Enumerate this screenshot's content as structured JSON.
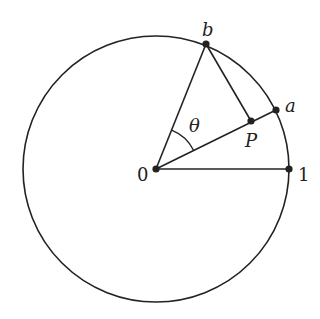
{
  "diagram": {
    "type": "unit-circle-geometry",
    "stroke_color": "#222222",
    "background": "#ffffff",
    "circle": {
      "cx": 156,
      "cy": 169,
      "r": 133
    },
    "points": {
      "origin": {
        "label": "0",
        "x": 156,
        "y": 169
      },
      "one": {
        "label": "1",
        "x": 289,
        "y": 169
      },
      "a": {
        "label": "a",
        "x": 276,
        "y": 110
      },
      "b": {
        "label": "b",
        "x": 206,
        "y": 44
      },
      "P": {
        "label": "P",
        "x": 251,
        "y": 121
      }
    },
    "angle": {
      "label": "θ",
      "between": [
        "0b",
        "0a"
      ]
    },
    "segments": [
      {
        "from": "origin",
        "to": "one"
      },
      {
        "from": "origin",
        "to": "a"
      },
      {
        "from": "origin",
        "to": "b"
      },
      {
        "from": "b",
        "to": "P"
      }
    ]
  }
}
